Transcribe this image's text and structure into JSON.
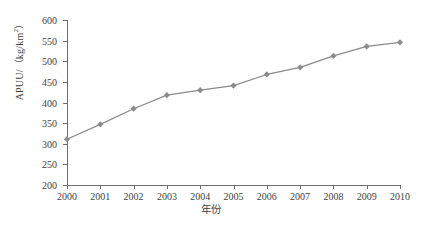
{
  "chart_data": {
    "type": "line",
    "title": "",
    "xlabel": "年份",
    "ylabel": "APUU/（kg/km²）",
    "ylabel_main": "APUU/（kg/km",
    "ylabel_sup": "2",
    "ylabel_tail": "）",
    "categories": [
      "2000",
      "2001",
      "2002",
      "2003",
      "2004",
      "2005",
      "2006",
      "2007",
      "2008",
      "2009",
      "2010"
    ],
    "values": [
      311,
      347,
      385,
      418,
      430,
      441,
      468,
      485,
      513,
      536,
      546
    ],
    "series": [
      {
        "name": "APUU",
        "values": [
          311,
          347,
          385,
          418,
          430,
          441,
          468,
          485,
          513,
          536,
          546
        ]
      }
    ],
    "ylim": [
      200,
      600
    ],
    "ytick_labels": [
      "600",
      "550",
      "500",
      "450",
      "400",
      "350",
      "300",
      "250",
      "200"
    ],
    "ytick_values": [
      600,
      550,
      500,
      450,
      400,
      350,
      300,
      250,
      200
    ],
    "xlim": [
      2000,
      2010
    ],
    "grid": false,
    "legend": "none",
    "marker": "diamond",
    "line_color": "#8a8a8a",
    "marker_color": "#8c8c8c",
    "axis_color": "#6e6e6e",
    "text_color": "#3f3f3f",
    "background": "#ffffff"
  }
}
